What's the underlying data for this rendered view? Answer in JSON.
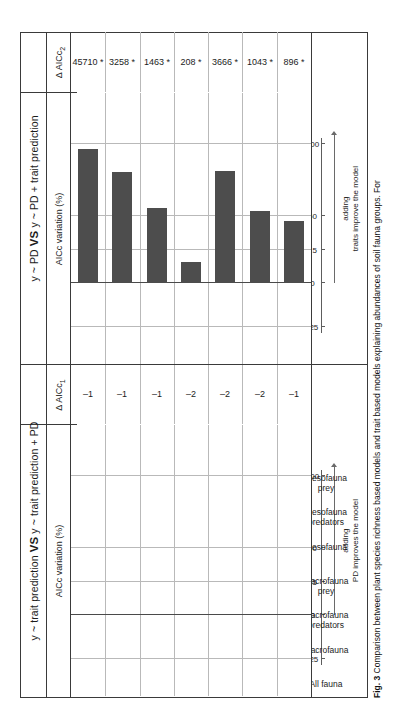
{
  "figure": {
    "caption_label": "Fig. 3",
    "caption_text": "Comparison between plant species richness based models and trait based models explaining abundances of soil fauna groups. For"
  },
  "panels": [
    {
      "id": "left",
      "title_prefix": "y ~ trait prediction ",
      "title_vs": "VS",
      "title_suffix": " y ~ trait prediction + PD",
      "y_axis_label": "AICc variation (%)",
      "delta_header_prefix": "Δ AICc",
      "delta_header_sub": "1",
      "axis_caption_line1": "adding",
      "axis_caption_line2": "PD improves the model"
    },
    {
      "id": "right",
      "title_prefix": "y ~ PD ",
      "title_vs": "VS",
      "title_suffix": " y ~ PD + trait prediction",
      "y_axis_label": "AICc variation (%)",
      "delta_header_prefix": "Δ AICc",
      "delta_header_sub": "2",
      "axis_caption_line1": "adding",
      "axis_caption_line2": "traits improve the model"
    }
  ],
  "chart_data": {
    "type": "bar",
    "title": "Comparison between plant species richness based models and trait based models",
    "categories": [
      "All fauna",
      "Macrofauna",
      "Macrofauna\npredators",
      "Macrofauna\nprey",
      "Mesofauna",
      "Mesofauna\npredators",
      "Mesofauna\nprey"
    ],
    "panels": [
      {
        "name": "y ~ trait prediction VS y ~ trait prediction + PD",
        "xlabel": "AICc variation (%)",
        "xlim": [
          -35,
          115
        ],
        "ticks": [
          -25,
          0,
          25,
          50,
          100
        ],
        "tick_labels": [
          "-25",
          "0",
          "25",
          "50",
          "100"
        ],
        "values": [
          0,
          0,
          0,
          0,
          0,
          0,
          0
        ],
        "delta_aicc_header": "Δ AICc1",
        "delta_aicc": [
          "–1",
          "–1",
          "–1",
          "–2",
          "–2",
          "–2",
          "–1"
        ],
        "annotation": "adding PD improves the model"
      },
      {
        "name": "y ~ PD VS y ~ PD + trait prediction",
        "xlabel": "AICc variation (%)",
        "xlim": [
          -35,
          115
        ],
        "ticks": [
          -25,
          0,
          15,
          50,
          100
        ],
        "tick_labels": [
          "-25",
          "0",
          "15",
          "50",
          "100"
        ],
        "values": [
          97,
          80,
          54,
          15,
          81,
          52,
          45
        ],
        "delta_aicc_header": "Δ AICc2",
        "delta_aicc": [
          "45710 *",
          "3258 *",
          "1463 *",
          "208 *",
          "3666 *",
          "1043 *",
          "896 *"
        ],
        "annotation": "adding traits improve the model"
      }
    ],
    "grid": true,
    "legend": "none",
    "bar_color": "#4d4d4d"
  }
}
